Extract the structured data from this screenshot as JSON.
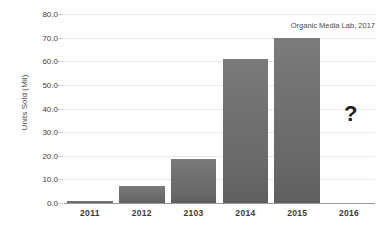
{
  "chart_data": {
    "type": "bar",
    "title": "",
    "subtitle": "",
    "xlabel": "",
    "ylabel": "Units Sold (Mil)",
    "categories": [
      "2011",
      "2012",
      "2103",
      "2014",
      "2015",
      "2016"
    ],
    "values": [
      0.9,
      7.2,
      18.8,
      61.0,
      70.0,
      null
    ],
    "ylim": [
      0,
      80
    ],
    "ytick_step": 10,
    "ytick_labels": [
      "80.0",
      "70.0",
      "60.0",
      "50.0",
      "40.0",
      "30.0",
      "20.0",
      "10.0",
      "0.0"
    ],
    "ytick_values": [
      80,
      70,
      60,
      50,
      40,
      30,
      20,
      10,
      0
    ],
    "grid": true,
    "legend": false,
    "legend_position": "none",
    "annotations": [
      {
        "name": "source-note",
        "text": "Organic Media Lab, 2017",
        "position": "top-right"
      },
      {
        "name": "unknown-marker",
        "text": "?",
        "category": "2016",
        "value": 37,
        "note": "question mark above the empty 2016 category"
      }
    ],
    "series_color": "#6e6e6e",
    "gridline_color": "#e9e9e9",
    "baseline_color": "#9a9a9a",
    "text_color": "#3a3a3a"
  }
}
